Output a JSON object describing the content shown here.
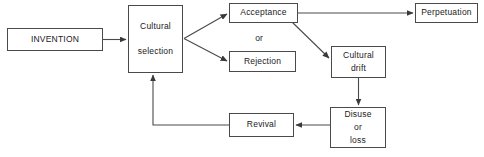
{
  "diagram": {
    "style": {
      "stroke": "#4a4a4a",
      "arrow_fill": "#3a3a3a",
      "text_color": "#1a1a1a",
      "background": "#ffffff"
    },
    "nodes": [
      {
        "id": "invention",
        "lines": [
          "INVENTION"
        ],
        "x": 7,
        "y": 28,
        "w": 96,
        "h": 23
      },
      {
        "id": "cultural-selection",
        "lines": [
          "Cultural",
          "selection"
        ],
        "x": 128,
        "y": 5,
        "w": 55,
        "h": 68
      },
      {
        "id": "acceptance",
        "lines": [
          "Acceptance"
        ],
        "x": 229,
        "y": 3,
        "w": 69,
        "h": 20
      },
      {
        "id": "rejection",
        "lines": [
          "Rejection"
        ],
        "x": 229,
        "y": 51,
        "w": 67,
        "h": 21
      },
      {
        "id": "perpetuation",
        "lines": [
          "Perpetuation"
        ],
        "x": 415,
        "y": 3,
        "w": 63,
        "h": 20
      },
      {
        "id": "cultural-drift",
        "lines": [
          "Cultural",
          "drift"
        ],
        "x": 331,
        "y": 46,
        "w": 55,
        "h": 32
      },
      {
        "id": "disuse-or-loss",
        "lines": [
          "Disuse",
          "or",
          "loss"
        ],
        "x": 330,
        "y": 107,
        "w": 56,
        "h": 41
      },
      {
        "id": "revival",
        "lines": [
          "Revival"
        ],
        "x": 229,
        "y": 113,
        "w": 65,
        "h": 24
      }
    ],
    "connector_labels": [
      {
        "id": "or-label",
        "text": "or",
        "x": 247,
        "y": 33,
        "w": 24
      }
    ],
    "edges": [
      {
        "id": "invention-to-cultural-selection",
        "from": "invention",
        "to": "cultural-selection",
        "kind": "horizontal-right"
      },
      {
        "id": "cultural-selection-to-acceptance",
        "from": "cultural-selection",
        "to": "acceptance",
        "kind": "diagonal-up-right"
      },
      {
        "id": "cultural-selection-to-rejection",
        "from": "cultural-selection",
        "to": "rejection",
        "kind": "diagonal-down-right"
      },
      {
        "id": "acceptance-to-perpetuation",
        "from": "acceptance",
        "to": "perpetuation",
        "kind": "horizontal-right"
      },
      {
        "id": "acceptance-to-cultural-drift",
        "from": "acceptance",
        "to": "cultural-drift",
        "kind": "diagonal-down-right"
      },
      {
        "id": "cultural-drift-to-disuse",
        "from": "cultural-drift",
        "to": "disuse-or-loss",
        "kind": "vertical-down"
      },
      {
        "id": "disuse-to-revival",
        "from": "disuse-or-loss",
        "to": "revival",
        "kind": "horizontal-left"
      },
      {
        "id": "revival-to-cultural-selection",
        "from": "revival",
        "to": "cultural-selection",
        "kind": "elbow-left-up"
      }
    ]
  }
}
